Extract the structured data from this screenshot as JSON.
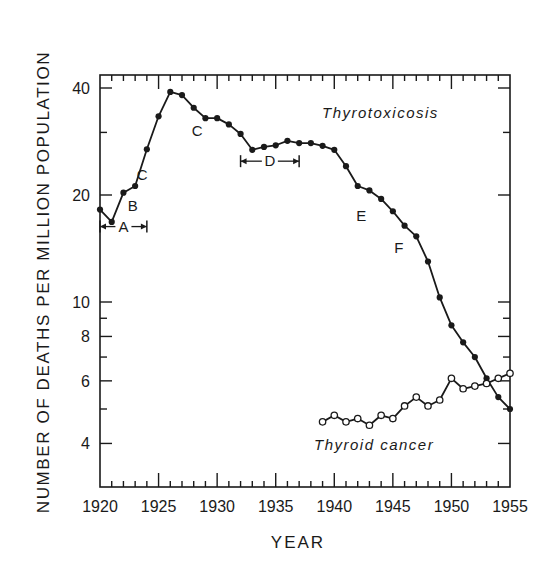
{
  "chart_data": {
    "type": "line",
    "title": "",
    "xlabel": "YEAR",
    "ylabel": "NUMBER OF DEATHS PER MILLION POPULATION",
    "yscale": "log",
    "xlim": [
      1920,
      1955
    ],
    "ylim": [
      3.3,
      44
    ],
    "grid": false,
    "x_ticks": [
      1920,
      1925,
      1930,
      1935,
      1940,
      1945,
      1950,
      1955
    ],
    "x_tick_labels": [
      "1920",
      "1925",
      "1930",
      "1935",
      "1940",
      "1945",
      "1950",
      "1955"
    ],
    "y_ticks": [
      4,
      6,
      8,
      10,
      20,
      40
    ],
    "y_tick_labels": [
      "4",
      "6",
      "8",
      "10",
      "20",
      "40"
    ],
    "series": [
      {
        "name": "Thyrotoxicosis",
        "marker": "filled-circle",
        "x": [
          1920,
          1921,
          1922,
          1923,
          1924,
          1925,
          1926,
          1927,
          1928,
          1929,
          1930,
          1931,
          1932,
          1933,
          1934,
          1935,
          1936,
          1937,
          1938,
          1939,
          1940,
          1941,
          1942,
          1943,
          1944,
          1945,
          1946,
          1947,
          1948,
          1949,
          1950,
          1951,
          1952,
          1953,
          1954,
          1955
        ],
        "values": [
          18.2,
          16.8,
          20.3,
          21.2,
          26.9,
          33.3,
          39.0,
          38.2,
          35.2,
          32.9,
          32.9,
          31.6,
          29.7,
          26.8,
          27.3,
          27.6,
          28.4,
          28.0,
          28.0,
          27.5,
          26.8,
          24.1,
          21.2,
          20.6,
          19.5,
          18.0,
          16.4,
          15.3,
          13.0,
          10.3,
          8.6,
          7.7,
          7.0,
          6.1,
          5.4,
          5.0
        ]
      },
      {
        "name": "Thyroid cancer",
        "marker": "open-circle",
        "x": [
          1939,
          1940,
          1941,
          1942,
          1943,
          1944,
          1945,
          1946,
          1947,
          1948,
          1949,
          1950,
          1951,
          1952,
          1953,
          1954,
          1955
        ],
        "values": [
          4.6,
          4.8,
          4.6,
          4.7,
          4.5,
          4.8,
          4.7,
          5.1,
          5.4,
          5.1,
          5.3,
          6.1,
          5.7,
          5.8,
          5.9,
          6.1,
          6.3
        ]
      }
    ],
    "annotations": [
      {
        "text": "A",
        "type": "interval",
        "x_start": 1920,
        "x_end": 1924,
        "at_value": 16.3
      },
      {
        "text": "B",
        "type": "label",
        "x": 1922.8,
        "value": 18.6
      },
      {
        "text": "C",
        "type": "label",
        "x": 1923.6,
        "value": 22.8
      },
      {
        "text": "C",
        "type": "label",
        "x": 1928.3,
        "value": 30.2
      },
      {
        "text": "D",
        "type": "interval",
        "x_start": 1932,
        "x_end": 1937,
        "at_value": 24.9
      },
      {
        "text": "E",
        "type": "label",
        "x": 1942.3,
        "value": 17.5
      },
      {
        "text": "F",
        "type": "label",
        "x": 1945.5,
        "value": 14.2
      }
    ],
    "legend": {
      "position": "inline",
      "entries": [
        "Thyrotoxicosis",
        "Thyroid cancer"
      ]
    }
  },
  "labels": {
    "ylabel": "NUMBER OF DEATHS PER MILLION POPULATION",
    "xlabel": "YEAR",
    "series_thyrotoxicosis": "Thyrotoxicosis",
    "series_thyroid_cancer": "Thyroid cancer"
  },
  "colors": {
    "ink": "#1a1a1a",
    "background": "#ffffff"
  }
}
